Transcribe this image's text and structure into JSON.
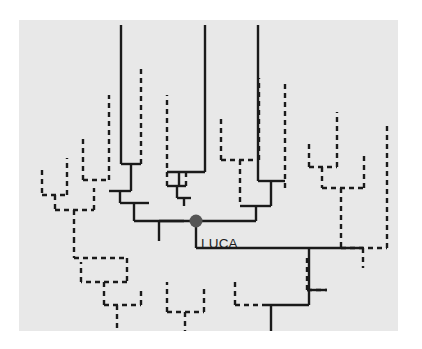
{
  "figure": {
    "background_color": "#ffffff",
    "panel_color": "#e8e8e8",
    "panel": {
      "x": 19,
      "y": 20,
      "width": 379,
      "height": 311
    }
  },
  "labels": {
    "luca": "LUCA",
    "luca_position": {
      "x": 200,
      "y": 243
    },
    "luca_color": "#1c1c1c",
    "luca_font_size": 13.5
  },
  "root_node": {
    "name": "LUCA node",
    "x": 176,
    "y": 221,
    "radius": 6.5,
    "color": "#555555"
  },
  "style": {
    "solid_stroke": "#1a1a1a",
    "dashed_stroke": "#1a1a1a",
    "solid_width": 2.4,
    "dashed_width": 2.4,
    "dash_pattern": "5,4"
  },
  "tree_structure": {
    "description": "Rooted universal tree of life. Solid lines denote extant/sampled lineages; dashed lines denote unsampled or inferred lineages. The filled circle marks LUCA, the last universal common ancestor.",
    "root_stem": {
      "from": [
        176,
        221
      ],
      "to": [
        176,
        248
      ]
    },
    "root_crossbar": {
      "y": 248,
      "x1": 176,
      "x2": 363
    },
    "node_bar": {
      "y": 221,
      "x1": 128,
      "x2": 248
    },
    "solid_segments": [
      {
        "name": "upper-left-clade-stem",
        "type": "v",
        "x": 128,
        "y1": 221,
        "y2": 203
      },
      {
        "name": "upper-left-clade-bar",
        "type": "h",
        "y": 203,
        "x1": 128,
        "x2": 180
      },
      {
        "name": "left-subclade-stem",
        "type": "v",
        "x": 128,
        "y1": 203,
        "y2": 191
      },
      {
        "name": "left-subclade-bar",
        "type": "h",
        "y": 191,
        "x1": 105,
        "x2": 128
      },
      {
        "name": "left-tip-a-stem",
        "type": "v",
        "x": 105,
        "y1": 191,
        "y2": 180
      },
      {
        "name": "left-tip-a-bar",
        "type": "h",
        "y": 180,
        "x1": 83,
        "x2": 105
      },
      {
        "name": "left-tip-a-dashleg",
        "type": "v",
        "x": 83,
        "y1": 180,
        "y2": 169
      },
      {
        "name": "left-inner-stem",
        "type": "v",
        "x": 110,
        "y1": 180,
        "y2": 164
      },
      {
        "name": "left-inner-bar",
        "type": "h",
        "y": 164,
        "x1": 110,
        "x2": 110
      },
      {
        "name": "tall-left-branch",
        "type": "v",
        "x": 121,
        "y1": 164,
        "y2": 25
      },
      {
        "name": "fork-left-bar",
        "type": "h",
        "y": 164,
        "x1": 121,
        "x2": 141
      },
      {
        "name": "fork-left-dashtip",
        "type": "v",
        "x": 141,
        "y1": 164,
        "y2": 66
      },
      {
        "name": "mid-clade-stem",
        "type": "v",
        "x": 180,
        "y1": 203,
        "y2": 196
      },
      {
        "name": "mid-clade-bar",
        "type": "h",
        "y": 196,
        "x1": 160,
        "x2": 180
      },
      {
        "name": "mid-left-stem",
        "type": "v",
        "x": 160,
        "y1": 196,
        "y2": 186
      },
      {
        "name": "mid-left-bar",
        "type": "h",
        "y": 186,
        "x1": 160,
        "x2": 186
      },
      {
        "name": "mid-tall-branch",
        "type": "v",
        "x": 205,
        "y1": 196,
        "y2": 25
      },
      {
        "name": "mid-short-branch",
        "type": "v",
        "x": 186,
        "y1": 186,
        "y2": 172
      },
      {
        "name": "mid-short-bar",
        "type": "h",
        "y": 172,
        "x1": 186,
        "x2": 203
      },
      {
        "name": "right-clade-stem",
        "type": "v",
        "x": 248,
        "y1": 221,
        "y2": 206
      },
      {
        "name": "right-clade-bar",
        "type": "h",
        "y": 206,
        "x1": 234,
        "x2": 272
      },
      {
        "name": "right-tall-branch",
        "type": "v",
        "x": 258,
        "y1": 188,
        "y2": 25
      },
      {
        "name": "right-inner-bar",
        "type": "h",
        "y": 188,
        "x1": 258,
        "x2": 285
      },
      {
        "name": "right-inner-stem",
        "type": "v",
        "x": 272,
        "y1": 206,
        "y2": 188
      },
      {
        "name": "bottom-right-stem",
        "type": "v",
        "x": 345,
        "y1": 248,
        "y2": 290
      },
      {
        "name": "bottom-right-bar",
        "type": "h",
        "y": 290,
        "x1": 308,
        "x2": 345
      },
      {
        "name": "bottom-right-stem2",
        "type": "v",
        "x": 308,
        "y1": 290,
        "y2": 305
      },
      {
        "name": "bottom-right-bar2",
        "type": "h",
        "y": 305,
        "x1": 255,
        "x2": 308
      },
      {
        "name": "bottom-right-tip",
        "type": "v",
        "x": 264,
        "y1": 305,
        "y2": 330
      }
    ],
    "dashed_groups": [
      {
        "name": "left-outer-clade",
        "tips": 2
      },
      {
        "name": "left-lower-clade",
        "tips": 4
      },
      {
        "name": "center-upper-dashed",
        "tips": 3
      },
      {
        "name": "center-lower-dashed",
        "tips": 3
      },
      {
        "name": "right-dashed-clade",
        "tips": 4
      },
      {
        "name": "bottom-center-dashed",
        "tips": 3
      }
    ]
  }
}
